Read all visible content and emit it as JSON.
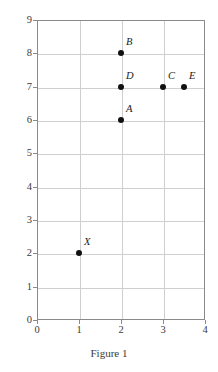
{
  "chart_data": {
    "type": "scatter",
    "title": "",
    "caption": "Figure 1",
    "xlabel": "",
    "ylabel": "",
    "xlim": [
      0,
      4
    ],
    "ylim": [
      0,
      9
    ],
    "xticks": [
      "0",
      "1",
      "2",
      "3",
      "4"
    ],
    "yticks": [
      "0",
      "1",
      "2",
      "3",
      "4",
      "5",
      "6",
      "7",
      "8",
      "9"
    ],
    "grid": true,
    "legend": "none",
    "points": [
      {
        "label": "B",
        "x": 2,
        "y": 8
      },
      {
        "label": "D",
        "x": 2,
        "y": 7
      },
      {
        "label": "A",
        "x": 2,
        "y": 6
      },
      {
        "label": "C",
        "x": 3,
        "y": 7
      },
      {
        "label": "E",
        "x": 3.5,
        "y": 7
      },
      {
        "label": "X",
        "x": 1,
        "y": 2
      }
    ]
  },
  "colors": {
    "point": "#111111",
    "grid": "#cfcfcf",
    "frame": "#8a8a8a",
    "text": "#3b3b3b"
  }
}
